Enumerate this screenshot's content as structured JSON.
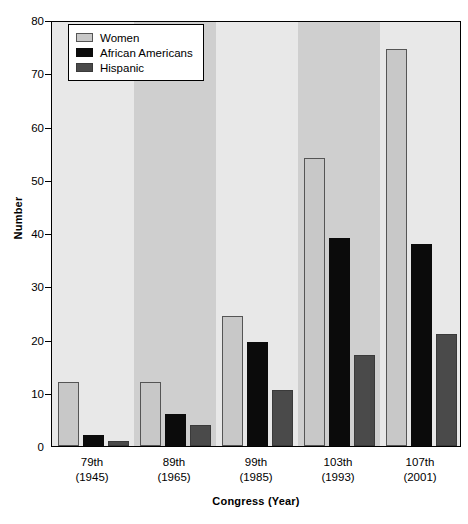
{
  "chart_data": {
    "type": "bar",
    "title": "",
    "xlabel": "Congress (Year)",
    "ylabel": "Number",
    "ylim": [
      0,
      80
    ],
    "yticks": [
      0,
      10,
      20,
      30,
      40,
      50,
      60,
      70,
      80
    ],
    "grid": false,
    "legend_position": "top-left",
    "categories": [
      "79th\n(1945)",
      "89th\n(1965)",
      "99th\n(1985)",
      "103th\n(1993)",
      "107th\n(2001)"
    ],
    "category_parts": [
      {
        "congress": "79th",
        "year": "(1945)"
      },
      {
        "congress": "89th",
        "year": "(1965)"
      },
      {
        "congress": "99th",
        "year": "(1985)"
      },
      {
        "congress": "103th",
        "year": "(1993)"
      },
      {
        "congress": "107th",
        "year": "(2001)"
      }
    ],
    "series": [
      {
        "name": "Women",
        "color": "#c8c8c8",
        "values": [
          12,
          12,
          24.5,
          54,
          74.5
        ]
      },
      {
        "name": "African Americans",
        "color": "#0b0b0b",
        "values": [
          2,
          6,
          19.5,
          39,
          38
        ]
      },
      {
        "name": "Hispanic",
        "color": "#4a4a4a",
        "values": [
          1,
          4,
          10.5,
          17,
          21
        ]
      }
    ]
  },
  "legend": {
    "items": [
      {
        "label": "Women",
        "swatch": "women"
      },
      {
        "label": "African Americans",
        "swatch": "african"
      },
      {
        "label": "Hispanic",
        "swatch": "hispanic"
      }
    ]
  },
  "axes": {
    "y_title": "Number",
    "x_title": "Congress (Year)"
  }
}
